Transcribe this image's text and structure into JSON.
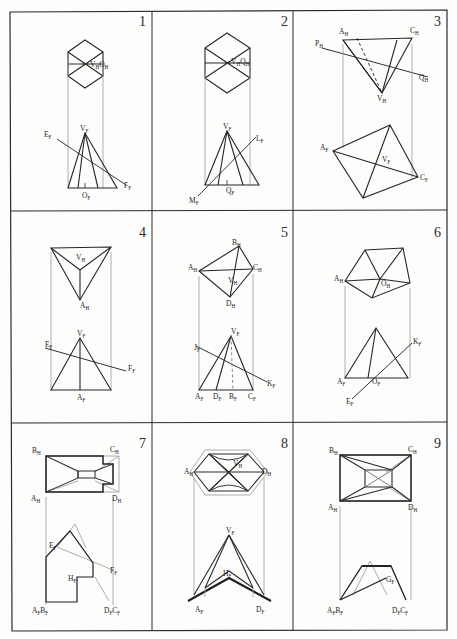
{
  "sheet": {
    "title": "Descriptive Geometry Exercise Sheet",
    "background_color": "#fdfdfb",
    "ink_color": "#1d1d1d",
    "faint_ink_color": "#a8a8a8",
    "rows": 3,
    "columns": 3
  },
  "panels": [
    {
      "number": "1",
      "row": 0,
      "col": 0,
      "top_view": {
        "shape": "hexagon",
        "description": "regular hexagon divided into six triangles by diagonals through centre"
      },
      "front_view": {
        "shape": "triangle",
        "description": "isosceles triangle (pyramid elevation) with interior edges and an oblique line crossing it"
      },
      "labels": [
        {
          "text": "V",
          "sub": "H",
          "x": 94,
          "y": 66
        },
        {
          "text": "O",
          "sub": "H",
          "x": 106,
          "y": 66
        },
        {
          "text": "V",
          "sub": "F",
          "x": 73,
          "y": 136
        },
        {
          "text": "E",
          "sub": "F",
          "x": 47,
          "y": 140
        },
        {
          "text": "O",
          "sub": "F",
          "x": 85,
          "y": 196
        },
        {
          "text": "F",
          "sub": "F",
          "x": 122,
          "y": 184
        }
      ]
    },
    {
      "number": "2",
      "row": 0,
      "col": 1,
      "top_view": {
        "shape": "hexagon",
        "description": "regular hexagon divided into six triangles by diagonals through centre"
      },
      "front_view": {
        "shape": "triangle",
        "description": "isosceles triangle with interior edges and an oblique line M-L crossing it"
      },
      "labels": [
        {
          "text": "V",
          "sub": "H",
          "x": 235,
          "y": 62
        },
        {
          "text": "Q",
          "sub": "H",
          "x": 247,
          "y": 62
        },
        {
          "text": "V",
          "sub": "F",
          "x": 228,
          "y": 134
        },
        {
          "text": "L",
          "sub": "F",
          "x": 258,
          "y": 140
        },
        {
          "text": "Q",
          "sub": "F",
          "x": 235,
          "y": 188
        },
        {
          "text": "M",
          "sub": "F",
          "x": 192,
          "y": 199
        }
      ]
    },
    {
      "number": "3",
      "row": 0,
      "col": 2,
      "top_view": {
        "shape": "triangle",
        "description": "triangle A-C-V with hidden dashed edge and oblique line P-Q crossing"
      },
      "front_view": {
        "shape": "quadrilateral",
        "description": "quadrilateral with both diagonals drawn"
      },
      "labels": [
        {
          "text": "A",
          "sub": "H",
          "x": 342,
          "y": 31
        },
        {
          "text": "C",
          "sub": "H",
          "x": 414,
          "y": 31
        },
        {
          "text": "P",
          "sub": "H",
          "x": 320,
          "y": 45
        },
        {
          "text": "Q",
          "sub": "H",
          "x": 423,
          "y": 77
        },
        {
          "text": "V",
          "sub": "H",
          "x": 382,
          "y": 97
        },
        {
          "text": "A",
          "sub": "F",
          "x": 323,
          "y": 146
        },
        {
          "text": "V",
          "sub": "F",
          "x": 383,
          "y": 159
        },
        {
          "text": "C",
          "sub": "F",
          "x": 421,
          "y": 176
        }
      ]
    },
    {
      "number": "4",
      "row": 1,
      "col": 0,
      "top_view": {
        "shape": "triangle",
        "description": "inverted triangle with apex A at bottom and three edges to V"
      },
      "front_view": {
        "shape": "triangle",
        "description": "isosceles triangle with vertical axis, crossed by oblique line E-F"
      },
      "labels": [
        {
          "text": "V",
          "sub": "H",
          "x": 80,
          "y": 257
        },
        {
          "text": "A",
          "sub": "H",
          "x": 85,
          "y": 305
        },
        {
          "text": "V",
          "sub": "F",
          "x": 81,
          "y": 337
        },
        {
          "text": "E",
          "sub": "F",
          "x": 49,
          "y": 348
        },
        {
          "text": "F",
          "sub": "F",
          "x": 128,
          "y": 367
        },
        {
          "text": "A",
          "sub": "F",
          "x": 82,
          "y": 397
        }
      ]
    },
    {
      "number": "5",
      "row": 1,
      "col": 1,
      "top_view": {
        "shape": "quadrilateral",
        "description": "quadrilateral A-B-C-D with both diagonals meeting at V"
      },
      "front_view": {
        "shape": "triangle",
        "description": "triangle with internal edges, dashed axis, and oblique line J-K"
      },
      "labels": [
        {
          "text": "B",
          "sub": "H",
          "x": 236,
          "y": 243
        },
        {
          "text": "A",
          "sub": "H",
          "x": 192,
          "y": 267
        },
        {
          "text": "C",
          "sub": "H",
          "x": 255,
          "y": 268
        },
        {
          "text": "V",
          "sub": "H",
          "x": 232,
          "y": 280
        },
        {
          "text": "D",
          "sub": "H",
          "x": 230,
          "y": 302
        },
        {
          "text": "V",
          "sub": "F",
          "x": 233,
          "y": 331
        },
        {
          "text": "J",
          "sub": "F",
          "x": 199,
          "y": 348
        },
        {
          "text": "K",
          "sub": "F",
          "x": 265,
          "y": 379
        },
        {
          "text": "A",
          "sub": "F",
          "x": 198,
          "y": 397
        },
        {
          "text": "D",
          "sub": "F",
          "x": 216,
          "y": 397
        },
        {
          "text": "B",
          "sub": "F",
          "x": 232,
          "y": 397
        },
        {
          "text": "C",
          "sub": "F",
          "x": 251,
          "y": 397
        }
      ]
    },
    {
      "number": "6",
      "row": 1,
      "col": 2,
      "top_view": {
        "shape": "pentagon",
        "description": "irregular pentagon with edges from centre O to each vertex"
      },
      "front_view": {
        "shape": "triangle",
        "description": "triangle with internal edge, crossed by oblique line E-K"
      },
      "labels": [
        {
          "text": "A",
          "sub": "H",
          "x": 338,
          "y": 277
        },
        {
          "text": "O",
          "sub": "H",
          "x": 382,
          "y": 282
        },
        {
          "text": "K",
          "sub": "F",
          "x": 420,
          "y": 341
        },
        {
          "text": "A",
          "sub": "F",
          "x": 341,
          "y": 379
        },
        {
          "text": "O",
          "sub": "F",
          "x": 375,
          "y": 379
        },
        {
          "text": "E",
          "sub": "F",
          "x": 350,
          "y": 396
        }
      ]
    },
    {
      "number": "7",
      "row": 2,
      "col": 0,
      "top_view": {
        "shape": "notched-rectangle",
        "description": "rectangle with right-hand notch containing a bowtie / inner-outline solid"
      },
      "front_view": {
        "shape": "stepped-polygon",
        "description": "stepped polygon elevation with faint construction lines E-F"
      },
      "labels": [
        {
          "text": "B",
          "sub": "H",
          "x": 36,
          "y": 452
        },
        {
          "text": "C",
          "sub": "H",
          "x": 113,
          "y": 452
        },
        {
          "text": "A",
          "sub": "H",
          "x": 35,
          "y": 497
        },
        {
          "text": "D",
          "sub": "H",
          "x": 115,
          "y": 497
        },
        {
          "text": "E",
          "sub": "F",
          "x": 53,
          "y": 546
        },
        {
          "text": "H",
          "sub": "F",
          "x": 73,
          "y": 578
        },
        {
          "text": "F",
          "sub": "F",
          "x": 110,
          "y": 571
        },
        {
          "text": "A",
          "sub": "F",
          "x": 36,
          "y": 609
        },
        {
          "text": "B",
          "sub": "F",
          "x": 45,
          "y": 609
        },
        {
          "text": "D",
          "sub": "F",
          "x": 108,
          "y": 609
        },
        {
          "text": "C",
          "sub": "F",
          "x": 117,
          "y": 609
        }
      ]
    },
    {
      "number": "8",
      "row": 2,
      "col": 1,
      "top_view": {
        "shape": "hexagon",
        "description": "hexagon with six triangles and concave curved outer faces"
      },
      "front_view": {
        "shape": "peaked-polygon",
        "description": "tall peak V with V-shaped base and inner apex H"
      },
      "labels": [
        {
          "text": "A",
          "sub": "H",
          "x": 189,
          "y": 470
        },
        {
          "text": "V",
          "sub": "H",
          "x": 237,
          "y": 463
        },
        {
          "text": "D",
          "sub": "H",
          "x": 264,
          "y": 470
        },
        {
          "text": "V",
          "sub": "F",
          "x": 228,
          "y": 532
        },
        {
          "text": "H",
          "sub": "F",
          "x": 227,
          "y": 573
        },
        {
          "text": "A",
          "sub": "F",
          "x": 198,
          "y": 607
        },
        {
          "text": "D",
          "sub": "F",
          "x": 259,
          "y": 607
        }
      ]
    },
    {
      "number": "9",
      "row": 2,
      "col": 2,
      "top_view": {
        "shape": "rectangle-with-inner-rectangle",
        "description": "rectangle with inner rectangle, corner connectors and an X in the centre"
      },
      "front_view": {
        "shape": "trapezoid",
        "description": "trapezoid elevation with faint construction triangle above and point G"
      },
      "labels": [
        {
          "text": "B",
          "sub": "H",
          "x": 332,
          "y": 452
        },
        {
          "text": "C",
          "sub": "H",
          "x": 411,
          "y": 452
        },
        {
          "text": "A",
          "sub": "H",
          "x": 330,
          "y": 505
        },
        {
          "text": "D",
          "sub": "H",
          "x": 411,
          "y": 505
        },
        {
          "text": "G",
          "sub": "F",
          "x": 390,
          "y": 578
        },
        {
          "text": "A",
          "sub": "F",
          "x": 330,
          "y": 609
        },
        {
          "text": "B",
          "sub": "F",
          "x": 339,
          "y": 609
        },
        {
          "text": "D",
          "sub": "F",
          "x": 396,
          "y": 609
        },
        {
          "text": "C",
          "sub": "F",
          "x": 405,
          "y": 609
        }
      ]
    }
  ]
}
